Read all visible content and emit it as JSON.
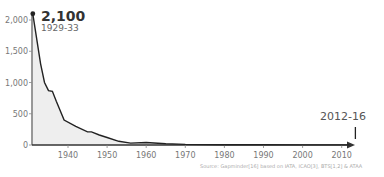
{
  "chart_data": {
    "type": "area",
    "title": "",
    "xlabel": "",
    "ylabel": "",
    "x": [
      1931,
      1933,
      1934,
      1935,
      1936,
      1937,
      1939,
      1942,
      1945,
      1946,
      1948,
      1950,
      1953,
      1956,
      1960,
      1965,
      1970,
      1980,
      1990,
      2000,
      2012
    ],
    "values": [
      2100,
      1300,
      1000,
      870,
      860,
      700,
      400,
      300,
      210,
      210,
      160,
      120,
      60,
      30,
      40,
      20,
      10,
      5,
      3,
      2,
      1
    ],
    "xlim": [
      1931,
      2014
    ],
    "ylim": [
      0,
      2100
    ],
    "x_ticks": [
      "1940",
      "1950",
      "1960",
      "1970",
      "1980",
      "1990",
      "2000",
      "2010"
    ],
    "y_ticks": [
      "0",
      "500",
      "1,000",
      "1,500",
      "2,000"
    ],
    "grid": false,
    "annotations": [
      {
        "label": "2,100",
        "sublabel": "1929-33",
        "x": 1931,
        "y": 2100
      },
      {
        "label": "2012-16",
        "x": 2012,
        "y": 1
      }
    ],
    "source": "Source: Gapminder[16] based on IATA, ICAO[3], BTS[1,2] & ATAA"
  },
  "labels": {
    "peak_value": "2,100",
    "peak_period": "1929-33",
    "end_period": "2012-16",
    "source": "Source: Gapminder[16] based on IATA, ICAO[3], BTS[1,2] & ATAA",
    "y_ticks": [
      "0",
      "500",
      "1,000",
      "1,500",
      "2,000"
    ],
    "x_ticks": [
      "1940",
      "1950",
      "1960",
      "1970",
      "1980",
      "1990",
      "2000",
      "2010"
    ]
  },
  "colors": {
    "line": "#222222",
    "fill": "#eeeeee",
    "axis": "#333333"
  }
}
